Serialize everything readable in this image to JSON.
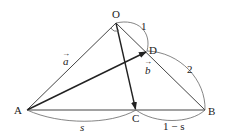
{
  "diagram": {
    "points": {
      "O": {
        "label": "O",
        "x": 116,
        "y": 23
      },
      "A": {
        "label": "A",
        "x": 27,
        "y": 110
      },
      "B": {
        "label": "B",
        "x": 205,
        "y": 110
      },
      "C": {
        "label": "C",
        "x": 136,
        "y": 110
      },
      "D": {
        "label": "D",
        "x": 147,
        "y": 51
      }
    },
    "vectors": {
      "a": {
        "label": "a",
        "arrow": "→"
      },
      "b": {
        "label": "b",
        "arrow": "→"
      }
    },
    "measures": {
      "OD": "1",
      "DB": "2",
      "AC": "s",
      "CB": "1 − s"
    },
    "colors": {
      "line": "#333333",
      "arc": "#555555",
      "text": "#222222"
    }
  }
}
